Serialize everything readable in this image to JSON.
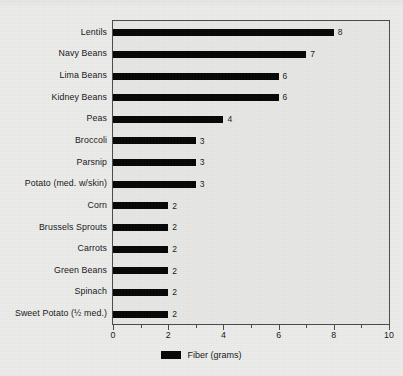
{
  "chart_data": {
    "type": "bar",
    "orientation": "horizontal",
    "title": "",
    "xlabel": "",
    "ylabel": "",
    "xlim": [
      0,
      10
    ],
    "xticks": [
      0,
      1,
      2,
      3,
      4,
      5,
      6,
      7,
      8,
      9,
      10
    ],
    "xtick_labels": [
      "0",
      "",
      "2",
      "",
      "4",
      "",
      "6",
      "",
      "8",
      "",
      "10"
    ],
    "grid": false,
    "legend_position": "bottom-center",
    "legend": [
      {
        "label": "Fiber (grams)",
        "color": "#050505"
      }
    ],
    "bar_color": "#050505",
    "plot_background": "#e7e7e6",
    "figure_background": "#ececeb",
    "axis_color": "#4a4a4a",
    "categories": [
      "Lentils",
      "Navy Beans",
      "Lima Beans",
      "Kidney Beans",
      "Peas",
      "Broccoli",
      "Parsnip",
      "Potato (med. w/skin)",
      "Corn",
      "Brussels Sprouts",
      "Carrots",
      "Green Beans",
      "Spinach",
      "Sweet Potato (½ med.)"
    ],
    "values": [
      8,
      7,
      6,
      6,
      4,
      3,
      3,
      3,
      2,
      2,
      2,
      2,
      2,
      2
    ],
    "data_labels": [
      "8",
      "7",
      "6",
      "6",
      "4",
      "3",
      "3",
      "3",
      "2",
      "2",
      "2",
      "2",
      "2",
      "2"
    ],
    "series": [
      {
        "name": "Fiber (grams)",
        "values": [
          8,
          7,
          6,
          6,
          4,
          3,
          3,
          3,
          2,
          2,
          2,
          2,
          2,
          2
        ]
      }
    ]
  }
}
